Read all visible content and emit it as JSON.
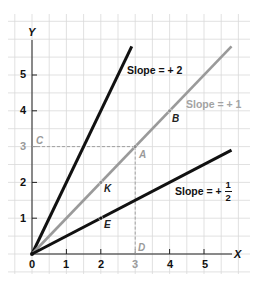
{
  "chart_data": {
    "type": "line",
    "title": "",
    "xlabel": "X",
    "ylabel": "Y",
    "xlim": [
      0,
      5.8
    ],
    "ylim": [
      0,
      5.8
    ],
    "grid": true,
    "x_ticks": [
      "0",
      "1",
      "2",
      "3",
      "4",
      "5"
    ],
    "y_ticks": [
      "1",
      "2",
      "3",
      "4",
      "5"
    ],
    "series": [
      {
        "name": "Slope = + 2",
        "slope": 2,
        "color": "#111111",
        "x": [
          0,
          2.9
        ],
        "y": [
          0,
          5.8
        ]
      },
      {
        "name": "Slope = + 1",
        "slope": 1,
        "color": "#9a9a9a",
        "x": [
          0,
          5.8
        ],
        "y": [
          0,
          5.8
        ]
      },
      {
        "name": "Slope = + 1/2",
        "slope": 0.5,
        "color": "#111111",
        "x": [
          0,
          5.8
        ],
        "y": [
          0,
          2.9
        ]
      }
    ],
    "points": [
      {
        "label": "A",
        "x": 3,
        "y": 3,
        "series": "Slope = + 1"
      },
      {
        "label": "B",
        "x": 4,
        "y": 4,
        "series": "Slope = + 1"
      },
      {
        "label": "K",
        "x": 2,
        "y": 2,
        "series": "Slope = + 1"
      },
      {
        "label": "E",
        "x": 2,
        "y": 1,
        "series": "Slope = + 1/2"
      }
    ],
    "reference_points": [
      {
        "label": "C",
        "x": 0,
        "y": 3
      },
      {
        "label": "D",
        "x": 3,
        "y": 0
      }
    ],
    "annotations": [
      "Slope = + 2",
      "Slope = + 1",
      "Slope = + 1/2"
    ],
    "dashed_guides": [
      {
        "from": "C",
        "to": "A"
      },
      {
        "from": "A",
        "to": "D"
      }
    ]
  },
  "labels": {
    "x_axis": "X",
    "y_axis": "Y",
    "x_ticks": [
      "0",
      "1",
      "2",
      "3",
      "4",
      "5"
    ],
    "y_ticks": [
      "1",
      "2",
      "3",
      "4",
      "5"
    ],
    "point_a": "A",
    "point_b": "B",
    "point_c": "C",
    "point_d": "D",
    "point_k": "K",
    "point_e": "E",
    "slope2": "Slope = + 2",
    "slope1": "Slope = + 1",
    "slope_half_prefix": "Slope = +",
    "slope_half_num": "1",
    "slope_half_den": "2"
  },
  "colors": {
    "dark_line": "#111111",
    "gray_line": "#9a9a9a",
    "grid": "#d9d9d9",
    "axis": "#222222"
  }
}
